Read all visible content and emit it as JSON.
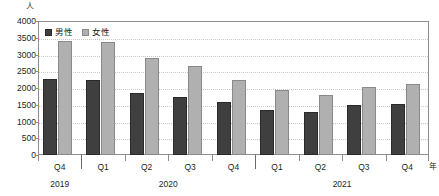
{
  "chart_data": {
    "type": "bar",
    "title": "",
    "xlabel": "年",
    "ylabel": "人",
    "ylim": [
      0,
      4000
    ],
    "ytick_step": 500,
    "yticks": [
      "4000",
      "3500",
      "3000",
      "2500",
      "2000",
      "1500",
      "1000",
      "500",
      "0"
    ],
    "grid": true,
    "legend_position": "top-left",
    "categories": [
      "Q4",
      "Q1",
      "Q2",
      "Q3",
      "Q4",
      "Q1",
      "Q2",
      "Q3",
      "Q4"
    ],
    "year_groups": [
      {
        "label": "2019",
        "quarters": [
          "Q4"
        ]
      },
      {
        "label": "2020",
        "quarters": [
          "Q1",
          "Q2",
          "Q3",
          "Q4"
        ]
      },
      {
        "label": "2021",
        "quarters": [
          "Q1",
          "Q2",
          "Q3",
          "Q4"
        ]
      }
    ],
    "series": [
      {
        "name": "男性",
        "color": "#3f3f3f",
        "values": [
          2270,
          2250,
          1850,
          1730,
          1570,
          1340,
          1290,
          1500,
          1530
        ]
      },
      {
        "name": "女性",
        "color": "#b0b0b0",
        "values": [
          3400,
          3380,
          2900,
          2650,
          2240,
          1950,
          1800,
          2030,
          2120
        ]
      }
    ]
  },
  "axis": {
    "y_unit": "人",
    "x_unit": "年"
  },
  "legend": {
    "items": [
      {
        "label": "男性"
      },
      {
        "label": "女性"
      }
    ]
  }
}
